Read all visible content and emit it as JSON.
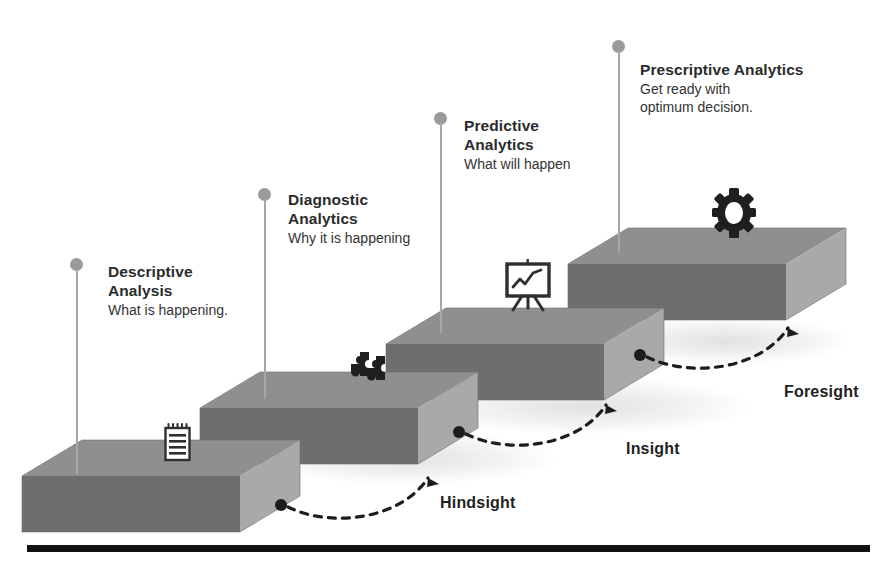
{
  "figure": {
    "title_hidden": "",
    "background": "#ffffff",
    "baseline_color": "#111111"
  },
  "palette": {
    "slab_top": "#8f8f8f",
    "slab_front": "#6e6e6e",
    "slab_side": "#a9a9a9",
    "pin": "#9a9a9a",
    "text_dark": "#2b2b2b",
    "text_body": "#333333",
    "arrow": "#1c1c1c",
    "baseline": "#111111"
  },
  "stages": [
    {
      "id": "descriptive",
      "title": "Descriptive\nAnalysis",
      "subtitle": "What is happening.",
      "icon": "notepad-icon",
      "pin": {
        "x": 70,
        "y": 258,
        "stem_height": 205
      },
      "label": {
        "x": 108,
        "y": 262
      },
      "slab": {
        "x": 22,
        "y": 440,
        "w": 278,
        "h": 98
      }
    },
    {
      "id": "diagnostic",
      "title": "Diagnostic\nAnalytics",
      "subtitle": "Why it is happening",
      "icon": "puzzle-icon",
      "pin": {
        "x": 258,
        "y": 188,
        "stem_height": 200
      },
      "label": {
        "x": 288,
        "y": 190
      },
      "slab": {
        "x": 200,
        "y": 372,
        "w": 278,
        "h": 98
      }
    },
    {
      "id": "predictive",
      "title": "Predictive\nAnalytics",
      "subtitle": "What will happen",
      "icon": "chart-easel-icon",
      "pin": {
        "x": 434,
        "y": 112,
        "stem_height": 210
      },
      "label": {
        "x": 464,
        "y": 116
      },
      "slab": {
        "x": 386,
        "y": 308,
        "w": 278,
        "h": 98
      }
    },
    {
      "id": "prescriptive",
      "title": "Prescriptive Analytics",
      "subtitle": "Get ready with\noptimum decision.",
      "icon": "gear-icon",
      "pin": {
        "x": 612,
        "y": 40,
        "stem_height": 202
      },
      "label": {
        "x": 640,
        "y": 60
      },
      "slab": {
        "x": 568,
        "y": 228,
        "w": 278,
        "h": 98
      }
    }
  ],
  "transitions": [
    {
      "id": "hindsight",
      "label": "Hindsight",
      "x": 440,
      "y": 494
    },
    {
      "id": "insight",
      "label": "Insight",
      "x": 626,
      "y": 440
    },
    {
      "id": "foresight",
      "label": "Foresight",
      "x": 784,
      "y": 383
    }
  ],
  "icon_glyphs": {
    "notepad-icon": "spiral-bound notepad with ruled lines",
    "puzzle-icon": "two interlocking puzzle pieces",
    "chart-easel-icon": "presentation easel with zigzag line chart",
    "gear-icon": "cog wheel"
  }
}
